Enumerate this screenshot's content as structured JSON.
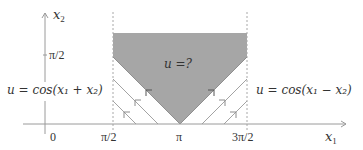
{
  "diagram": {
    "axes": {
      "x_label": "x",
      "x_label_sub": "1",
      "y_label": "x",
      "y_label_sub": "2",
      "x_ticks": [
        {
          "value": "0",
          "label": "0"
        },
        {
          "value": "pi/2",
          "label": "π/2"
        },
        {
          "value": "pi",
          "label": "π"
        },
        {
          "value": "3pi/2",
          "label": "3π/2"
        }
      ],
      "y_ticks": [
        {
          "value": "pi/2",
          "label": "π/2"
        }
      ]
    },
    "region": {
      "label": "u =?",
      "color": "#a6a6a6",
      "description": "unknown region bounded by characteristics from (π,0)"
    },
    "boundary_labels": {
      "left": "u = cos(x₁ + x₂)",
      "right": "u = cos(x₁ − x₂)"
    },
    "dashed_lines_at_x1": [
      "π/2",
      "3π/2"
    ],
    "characteristics": {
      "left_family": "x₁ + x₂ = const, arrows pointing up-left",
      "right_family": "x₁ − x₂ = const, arrows pointing up-right"
    }
  }
}
